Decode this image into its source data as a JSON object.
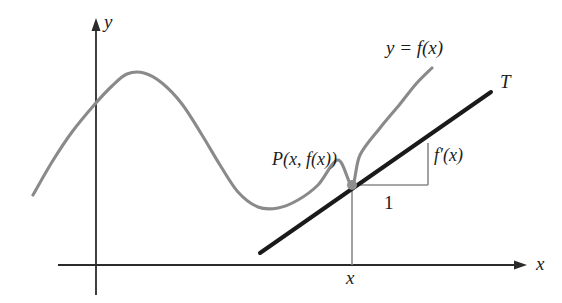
{
  "figure": {
    "background_color": "#ffffff"
  },
  "labels": {
    "axis_y": "y",
    "axis_x": "x",
    "curve": "y = f(x)",
    "tangent": "T",
    "point": "P(x, f(x))",
    "rise": "f′(x)",
    "run": "1",
    "x_tick": "x"
  },
  "colors": {
    "curve": "#8a8a8a",
    "tangent": "#1a1a1a",
    "axis": "#2b2b2b",
    "helper": "#8a8a8a",
    "point_fill": "#8f8f8f",
    "text": "#1c1c1c"
  },
  "chart_data": {
    "type": "line",
    "xlabel": "x",
    "ylabel": "y",
    "grid": false,
    "legend": "none",
    "axes": {
      "y_axis_x_px": 96,
      "y_axis_top_px": 20,
      "y_axis_bottom_px": 295,
      "x_axis_y_px": 265,
      "x_axis_left_px": 58,
      "x_axis_right_px": 528,
      "origin_px": [
        96,
        265
      ],
      "arrows": [
        "y-up",
        "x-right"
      ]
    },
    "series": [
      {
        "name": "y = f(x)",
        "color": "#8a8a8a",
        "kind": "curve",
        "points_px": [
          [
            33,
            195
          ],
          [
            52,
            162
          ],
          [
            72,
            132
          ],
          [
            95,
            104
          ],
          [
            112,
            86
          ],
          [
            127,
            74
          ],
          [
            144,
            73
          ],
          [
            162,
            83
          ],
          [
            182,
            104
          ],
          [
            202,
            135
          ],
          [
            220,
            165
          ],
          [
            238,
            192
          ],
          [
            258,
            207
          ],
          [
            278,
            208
          ],
          [
            298,
            200
          ],
          [
            318,
            185
          ],
          [
            338,
            160
          ],
          [
            352,
            185
          ],
          [
            360,
            155
          ],
          [
            380,
            128
          ],
          [
            400,
            104
          ],
          [
            416,
            84
          ],
          [
            432,
            68
          ]
        ],
        "features": {
          "local_maximum_px": [
            127,
            74
          ],
          "local_minimum_px": [
            258,
            207
          ],
          "left_end_px": [
            33,
            195
          ],
          "right_end_px": [
            432,
            68
          ]
        }
      },
      {
        "name": "T",
        "color": "#1a1a1a",
        "kind": "tangent-line",
        "from_px": [
          260,
          253
        ],
        "to_px": [
          491,
          92
        ],
        "through_px": [
          352,
          185
        ],
        "slope": "f′(x)"
      }
    ],
    "annotations": [
      {
        "name": "point-P",
        "kind": "dot",
        "at_px": [
          352,
          185
        ],
        "label": "P(x, f(x))",
        "label_px": [
          272,
          150
        ],
        "color": "#8f8f8f",
        "radius_px": 5
      },
      {
        "name": "slope-triangle-run",
        "kind": "segment",
        "from_px": [
          352,
          185
        ],
        "to_px": [
          428,
          185
        ],
        "label": "1",
        "label_px": [
          384,
          193
        ],
        "color": "#8a8a8a"
      },
      {
        "name": "slope-triangle-rise",
        "kind": "segment",
        "from_px": [
          428,
          185
        ],
        "to_px": [
          428,
          143
        ],
        "label": "f′(x)",
        "label_px": [
          434,
          146
        ],
        "color": "#8a8a8a"
      },
      {
        "name": "drop-line-to-x-axis",
        "kind": "segment",
        "from_px": [
          352,
          185
        ],
        "to_px": [
          352,
          265
        ],
        "label": "x",
        "label_px": [
          346,
          268
        ],
        "color": "#8a8a8a"
      },
      {
        "name": "curve-label",
        "kind": "text",
        "text": "y = f(x)",
        "label_px": [
          386,
          38
        ]
      },
      {
        "name": "tangent-label",
        "kind": "text",
        "text": "T",
        "label_px": [
          500,
          72
        ]
      }
    ]
  }
}
